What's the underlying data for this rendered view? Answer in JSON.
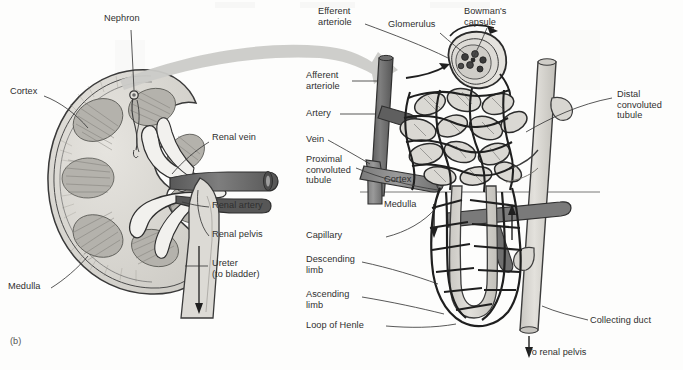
{
  "figure": {
    "panel_tag": "(b)",
    "background_color": "#fdfdfc",
    "ink_color": "#2f2f2f"
  },
  "kidney_panel": {
    "name": "kidney-cross-section",
    "labels": [
      {
        "id": "nephron",
        "text": "Nephron",
        "x": 104,
        "y": 19,
        "align": "left"
      },
      {
        "id": "cortex",
        "text": "Cortex",
        "x": 10,
        "y": 92,
        "align": "left"
      },
      {
        "id": "renal-vein",
        "text": "Renal vein",
        "x": 212,
        "y": 138,
        "align": "left"
      },
      {
        "id": "renal-artery",
        "text": "Renal artery",
        "x": 212,
        "y": 204,
        "align": "left"
      },
      {
        "id": "renal-pelvis",
        "text": "Renal pelvis",
        "x": 212,
        "y": 233,
        "align": "left"
      },
      {
        "id": "ureter",
        "text": "Ureter\n(to bladder)",
        "x": 212,
        "y": 262,
        "align": "left"
      },
      {
        "id": "medulla",
        "text": "Medulla",
        "x": 8,
        "y": 286,
        "align": "left"
      }
    ]
  },
  "nephron_panel": {
    "name": "nephron-detail",
    "labels": [
      {
        "id": "efferent-arteriole",
        "text": "Efferent\narteriole",
        "x": 318,
        "y": 9,
        "align": "left"
      },
      {
        "id": "glomerulus",
        "text": "Glomerulus",
        "x": 388,
        "y": 22,
        "align": "left"
      },
      {
        "id": "bowmans-capsule",
        "text": "Bowman's\ncapsule",
        "x": 464,
        "y": 9,
        "align": "left"
      },
      {
        "id": "afferent-arteriole",
        "text": "Afferent\narteriole",
        "x": 306,
        "y": 73,
        "align": "left"
      },
      {
        "id": "artery",
        "text": "Artery",
        "x": 306,
        "y": 110,
        "align": "left"
      },
      {
        "id": "vein",
        "text": "Vein",
        "x": 306,
        "y": 136,
        "align": "left"
      },
      {
        "id": "proximal-convoluted-tubule",
        "text": "Proximal\nconvoluted\ntubule",
        "x": 306,
        "y": 158,
        "align": "left"
      },
      {
        "id": "distal-convoluted-tubule",
        "text": "Distal\nconvoluted\ntubule",
        "x": 617,
        "y": 92,
        "align": "left"
      },
      {
        "id": "cortex-n",
        "text": "Cortex",
        "x": 384,
        "y": 178,
        "align": "left"
      },
      {
        "id": "medulla-n",
        "text": "Medulla",
        "x": 384,
        "y": 203,
        "align": "left"
      },
      {
        "id": "capillary",
        "text": "Capillary",
        "x": 306,
        "y": 231,
        "align": "left"
      },
      {
        "id": "descending-limb",
        "text": "Descending\nlimb",
        "x": 306,
        "y": 256,
        "align": "left"
      },
      {
        "id": "ascending-limb",
        "text": "Ascending\nlimb",
        "x": 306,
        "y": 291,
        "align": "left"
      },
      {
        "id": "loop-of-henle",
        "text": "Loop of Henle",
        "x": 306,
        "y": 322,
        "align": "left"
      },
      {
        "id": "collecting-duct",
        "text": "Collecting duct",
        "x": 590,
        "y": 318,
        "align": "left"
      },
      {
        "id": "to-renal-pelvis",
        "text": "To renal pelvis",
        "x": 527,
        "y": 350,
        "align": "left"
      }
    ]
  },
  "colors": {
    "artery_dark": "#6c6c6c",
    "vein_mid": "#8a8a8a",
    "tubule_light": "#d6d6d2",
    "capillary_outline": "#2b2b2b",
    "kidney_fill": "#d9d7d2",
    "kidney_inner": "#c4c2bc",
    "medulla_fill": "#b9b7b1",
    "magnify_arrow": "#c9c9c6",
    "leader_line": "#3a3a3a"
  }
}
